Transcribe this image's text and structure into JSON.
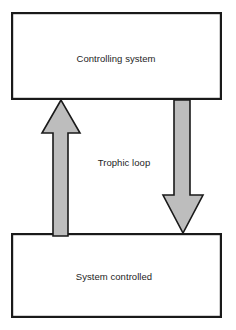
{
  "diagram": {
    "title_text": "Trophic loop",
    "canvas": {
      "width": 236,
      "height": 330,
      "background": "#ffffff"
    },
    "colors": {
      "stroke": "#1a1a1a",
      "box_fill": "#ffffff",
      "arrow_fill": "#bdbdbd",
      "text": "#1d1d1d"
    },
    "nodes": [
      {
        "id": "controlling-system",
        "label": "Controlling system",
        "shape": "rectangle",
        "x": 11,
        "y": 12,
        "width": 211,
        "height": 88,
        "label_cx": 116,
        "label_cy": 58
      },
      {
        "id": "system-controlled",
        "label": "System controlled",
        "shape": "rectangle",
        "x": 11,
        "y": 233,
        "width": 211,
        "height": 85,
        "label_cx": 114,
        "label_cy": 276
      }
    ],
    "connectors": [
      {
        "id": "upward-arrow",
        "label": "",
        "direction": "up",
        "from": "system-controlled",
        "to": "controlling-system",
        "fill": "#bdbdbd",
        "points": "61,100 42,133 53,133 53,236 68,236 68,133 80,133",
        "shaft_x": 53,
        "shaft_width": 15,
        "head_top_y": 100,
        "head_base_y": 133,
        "tail_y": 236
      },
      {
        "id": "downward-arrow",
        "label": "",
        "direction": "down",
        "from": "controlling-system",
        "to": "system-controlled",
        "fill": "#bdbdbd",
        "points": "174,100 190,100 190,195 203,195 183,233 163,195 174,195",
        "shaft_x": 174,
        "shaft_width": 16,
        "head_base_y": 195,
        "head_tip_y": 233,
        "tail_y": 100
      }
    ],
    "center_label": {
      "text": "Trophic loop",
      "cx": 124,
      "cy": 162
    }
  }
}
